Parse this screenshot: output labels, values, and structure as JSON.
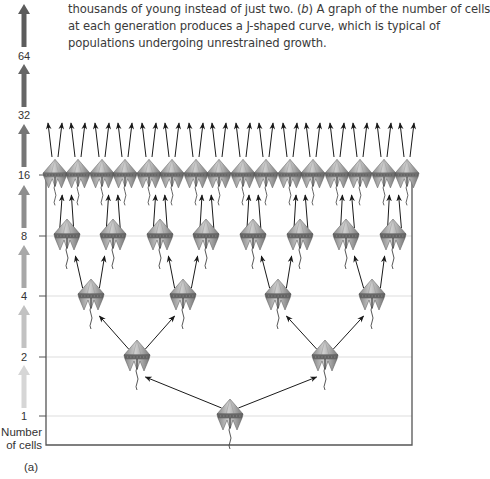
{
  "caption": {
    "line1_pre": "thousands of young instead of just two. (",
    "line1_b": "b",
    "line1_post": ") A graph of the number of cells",
    "line2": "at each generation produces a J-shaped curve, which is typical of",
    "line3": "populations undergoing unrestrained growth."
  },
  "axis": {
    "title_line1": "Number",
    "title_line2": "of cells",
    "panel_label": "(a)",
    "ticks": [
      {
        "label": "1",
        "y": 416
      },
      {
        "label": "2",
        "y": 357
      },
      {
        "label": "4",
        "y": 296
      },
      {
        "label": "8",
        "y": 236
      },
      {
        "label": "16",
        "y": 175
      },
      {
        "label": "32",
        "y": 115
      },
      {
        "label": "64",
        "y": 56
      }
    ],
    "left_x": 46,
    "right_x": 412,
    "bottom_y": 445,
    "top_y": 175
  },
  "growth_arrows": [
    {
      "from_y": 408,
      "to_y": 365,
      "color": "#d6d6d6"
    },
    {
      "from_y": 348,
      "to_y": 305,
      "color": "#c2c2c2"
    },
    {
      "from_y": 288,
      "to_y": 245,
      "color": "#a8a8a8"
    },
    {
      "from_y": 228,
      "to_y": 185,
      "color": "#8e8e8e"
    },
    {
      "from_y": 167,
      "to_y": 124,
      "color": "#767676"
    },
    {
      "from_y": 107,
      "to_y": 64,
      "color": "#666666"
    },
    {
      "from_y": 47,
      "to_y": 4,
      "color": "#5c5c5c"
    }
  ],
  "generations": [
    {
      "count": 1,
      "y": 416,
      "xs": [
        230
      ]
    },
    {
      "count": 2,
      "y": 357,
      "xs": [
        137,
        325
      ]
    },
    {
      "count": 4,
      "y": 296,
      "xs": [
        91,
        183,
        278,
        372
      ]
    },
    {
      "count": 8,
      "y": 236,
      "xs": [
        67,
        113,
        160,
        206,
        253,
        300,
        346,
        393
      ]
    },
    {
      "count": 16,
      "y": 175,
      "xs": [
        55,
        78,
        102,
        125,
        149,
        172,
        196,
        219,
        243,
        266,
        290,
        313,
        337,
        360,
        384,
        407
      ]
    }
  ],
  "chart_data": {
    "type": "diagram",
    "ylabel": "Number of cells",
    "y_ticks": [
      1,
      2,
      4,
      8,
      16,
      32,
      64
    ],
    "generations": [
      1,
      2,
      4,
      8,
      16
    ],
    "panel": "(a)"
  },
  "colors": {
    "cell_fill": "#a9a9a9",
    "cell_light": "#c8c8c8",
    "cell_dark": "#6e6e6e",
    "arrow": "#1a1a1a",
    "grid": "#dddddd",
    "axis": "#555555"
  }
}
